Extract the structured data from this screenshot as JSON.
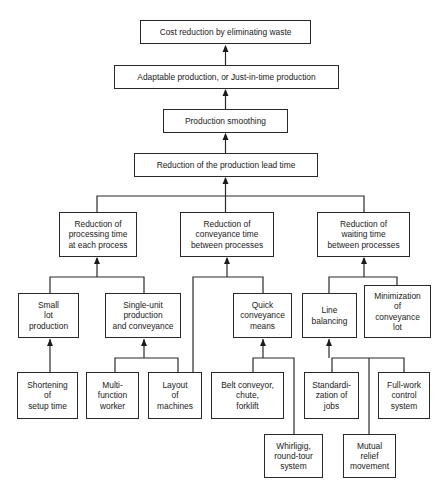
{
  "diagram": {
    "type": "hierarchy",
    "direction": "bottom-up",
    "nodes": [
      {
        "id": "cost",
        "label": "Cost reduction by eliminating waste",
        "box": [
          140,
          20,
          171,
          24
        ]
      },
      {
        "id": "adaptable",
        "label": "Adaptable production, or Just-in-time production",
        "box": [
          114,
          65,
          225,
          24
        ]
      },
      {
        "id": "smoothing",
        "label": "Production smoothing",
        "box": [
          163,
          109,
          125,
          24
        ]
      },
      {
        "id": "leadtime",
        "label": "Reduction of the production lead time",
        "box": [
          134,
          153,
          184,
          24
        ]
      },
      {
        "id": "processing",
        "label": "Reduction of\nprocessing time\nat each process",
        "box": [
          59,
          212,
          78,
          45
        ]
      },
      {
        "id": "conveyance",
        "label": "Reduction of\nconveyance time\nbetween processes",
        "box": [
          180,
          212,
          94,
          45
        ]
      },
      {
        "id": "waiting",
        "label": "Reduction of\nwaiting time\nbetween processes",
        "box": [
          317,
          212,
          93,
          45
        ]
      },
      {
        "id": "smalllot",
        "label": "Small\nlot\nproduction",
        "box": [
          18,
          293,
          61,
          45
        ]
      },
      {
        "id": "singleunit",
        "label": "Single-unit\nproduction\nand conveyance",
        "box": [
          105,
          293,
          76,
          45
        ]
      },
      {
        "id": "quick",
        "label": "Quick\nconveyance\nmeans",
        "box": [
          233,
          293,
          59,
          45
        ]
      },
      {
        "id": "linebal",
        "label": "Line\nbalancing",
        "box": [
          302,
          293,
          55,
          45
        ]
      },
      {
        "id": "minlot",
        "label": "Minimization\nof\nconveyance\nlot",
        "box": [
          364,
          285,
          67,
          53
        ]
      },
      {
        "id": "setup",
        "label": "Shortening\nof\nsetup time",
        "box": [
          17,
          372,
          61,
          47
        ]
      },
      {
        "id": "multi",
        "label": "Multi-\nfunction\nworker",
        "box": [
          86,
          372,
          53,
          47
        ]
      },
      {
        "id": "layout",
        "label": "Layout\nof\nmachines",
        "box": [
          148,
          372,
          54,
          47
        ]
      },
      {
        "id": "belt",
        "label": "Belt conveyor,\nchute,\nforklift",
        "box": [
          211,
          372,
          73,
          47
        ]
      },
      {
        "id": "standard",
        "label": "Standardi-\nzation of\njobs",
        "box": [
          304,
          372,
          55,
          47
        ]
      },
      {
        "id": "fullwork",
        "label": "Full-work\ncontrol\nsystem",
        "box": [
          378,
          372,
          52,
          47
        ]
      },
      {
        "id": "whirligig",
        "label": "Whirligig,\nround-tour\nsystem",
        "box": [
          264,
          434,
          59,
          44
        ]
      },
      {
        "id": "mutual",
        "label": "Mutual\nrelief\nmovement",
        "box": [
          343,
          434,
          53,
          44
        ]
      }
    ],
    "edges": [
      {
        "from": "adaptable",
        "to": "cost"
      },
      {
        "from": "smoothing",
        "to": "adaptable"
      },
      {
        "from": "leadtime",
        "to": "smoothing"
      },
      {
        "from": "processing",
        "to": "leadtime"
      },
      {
        "from": "conveyance",
        "to": "leadtime"
      },
      {
        "from": "waiting",
        "to": "leadtime"
      },
      {
        "from": "smalllot",
        "to": "processing"
      },
      {
        "from": "singleunit",
        "to": "processing"
      },
      {
        "from": "layout",
        "to": "conveyance"
      },
      {
        "from": "quick",
        "to": "conveyance"
      },
      {
        "from": "linebal",
        "to": "waiting"
      },
      {
        "from": "minlot",
        "to": "waiting"
      },
      {
        "from": "setup",
        "to": "smalllot"
      },
      {
        "from": "multi",
        "to": "singleunit"
      },
      {
        "from": "layout",
        "to": "singleunit"
      },
      {
        "from": "belt",
        "to": "quick"
      },
      {
        "from": "whirligig",
        "to": "quick"
      },
      {
        "from": "standard",
        "to": "linebal"
      },
      {
        "from": "fullwork",
        "to": "linebal"
      },
      {
        "from": "mutual",
        "to": "linebal"
      }
    ]
  },
  "style": {
    "line_color": "#2a2a2a",
    "box_border": "#2a2a2a",
    "background": "#ffffff"
  }
}
